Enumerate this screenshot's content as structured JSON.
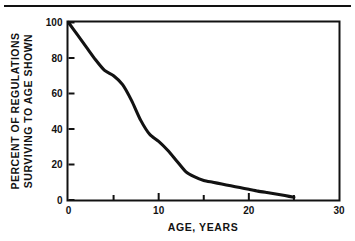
{
  "figure": {
    "background_color": "#ffffff",
    "ink_color": "#121212",
    "top_rule": true
  },
  "chart_data": {
    "type": "line",
    "title": "",
    "subtitle": "",
    "xlabel": "AGE, YEARS",
    "ylabel_line1": "PERCENT OF  REGULATIONS",
    "ylabel_line2": "SURVIVING TO  AGE SHOWN",
    "xlim": [
      0,
      30
    ],
    "ylim": [
      0,
      100
    ],
    "grid": false,
    "legend": "none",
    "x_major_ticks": [
      0,
      10,
      20,
      30
    ],
    "x_minor_ticks": [
      5,
      15,
      25
    ],
    "x_tick_labels": [
      "0",
      "10",
      "20",
      "30"
    ],
    "y_major_ticks": [
      0,
      20,
      40,
      60,
      80,
      100
    ],
    "y_tick_labels": [
      "0",
      "20",
      "40",
      "60",
      "80",
      "100"
    ],
    "series": [
      {
        "name": "Percent of regulations surviving",
        "x": [
          0,
          1,
          2,
          3,
          4,
          5,
          6,
          7,
          8,
          9,
          10,
          11,
          12,
          13,
          14,
          15,
          16,
          17,
          18,
          19,
          20,
          21,
          22,
          23,
          24,
          25
        ],
        "values": [
          100,
          93,
          86,
          79,
          73,
          70,
          65,
          56,
          45,
          37,
          33,
          28,
          22,
          16,
          13,
          11,
          10,
          9,
          8,
          7,
          6,
          5,
          4.2,
          3.4,
          2.5,
          1.5
        ]
      }
    ],
    "annotations": []
  }
}
